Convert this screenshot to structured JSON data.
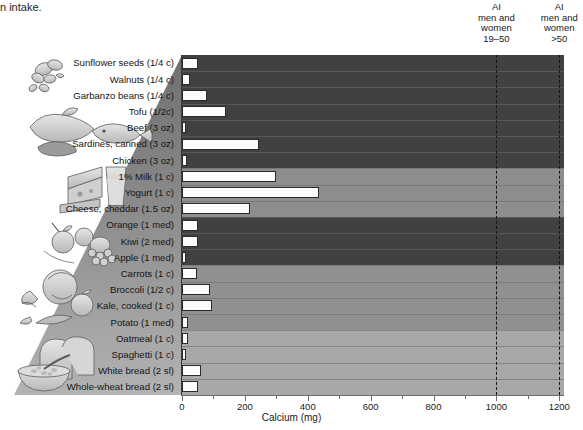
{
  "caption_fragment": "n intake.",
  "chart_data": {
    "type": "bar",
    "orientation": "horizontal",
    "title": "",
    "xlabel": "Calcium (mg)",
    "ylabel": "",
    "xlim": [
      0,
      1215
    ],
    "xticks": [
      0,
      200,
      400,
      600,
      800,
      1000,
      1200
    ],
    "xticklabels": [
      "0",
      "200",
      "400",
      "600",
      "800",
      "1000",
      "1200"
    ],
    "grid": false,
    "legend": "none",
    "bar_color": "#fbfbfb",
    "bar_edge_color": "#2b2b2b",
    "categories": [
      "Sunflower seeds (1/4 c)",
      "Walnuts (1/4 c)",
      "Garbanzo beans (1/4 c)",
      "Tofu (1/2c)",
      "Beef (3 oz)",
      "Sardines, canned (3 oz)",
      "Chicken (3 oz)",
      "1% Milk (1 c)",
      "Yogurt (1 c)",
      "Cheese, cheddar (1.5 oz)",
      "Orange (1 med)",
      "Kiwi (2 med)",
      "Apple (1 med)",
      "Carrots (1 c)",
      "Broccoli (1/2 c)",
      "Kale, cooked (1 c)",
      "Potato (1 med)",
      "Oatmeal (1 c)",
      "Spaghetti (1 c)",
      "White bread (2 sl)",
      "Whole-wheat bread (2 sl)"
    ],
    "values": [
      50,
      25,
      80,
      140,
      10,
      245,
      15,
      300,
      437,
      215,
      52,
      50,
      10,
      48,
      90,
      95,
      20,
      20,
      12,
      60,
      50
    ],
    "annotations": [
      {
        "name": "ai-19-50",
        "value": 1000,
        "style": "dashed-vertical",
        "label_lines": [
          "AI",
          "men and",
          "women",
          "19–50"
        ]
      },
      {
        "name": "ai-over-50",
        "value": 1200,
        "style": "dashed-vertical",
        "label_lines": [
          "AI",
          "men and",
          "women",
          ">50"
        ]
      }
    ],
    "groups": [
      {
        "name": "protein",
        "first": 0,
        "count": 7,
        "band_color": "#414141"
      },
      {
        "name": "dairy",
        "first": 7,
        "count": 3,
        "band_color": "#8d8d8d"
      },
      {
        "name": "fruits",
        "first": 10,
        "count": 3,
        "band_color": "#414141"
      },
      {
        "name": "vegetables",
        "first": 13,
        "count": 4,
        "band_color": "#909090"
      },
      {
        "name": "grains",
        "first": 17,
        "count": 4,
        "band_color": "#a8a8a8"
      }
    ]
  },
  "pyramid": {
    "illustrations": [
      {
        "name": "nuts-and-seeds-illustration",
        "group": "protein"
      },
      {
        "name": "meat-and-fish-illustration",
        "group": "protein"
      },
      {
        "name": "cheese-and-milk-illustration",
        "group": "dairy"
      },
      {
        "name": "fruit-illustration",
        "group": "fruits"
      },
      {
        "name": "vegetables-illustration",
        "group": "vegetables"
      },
      {
        "name": "bread-and-cereal-illustration",
        "group": "grains"
      }
    ]
  }
}
